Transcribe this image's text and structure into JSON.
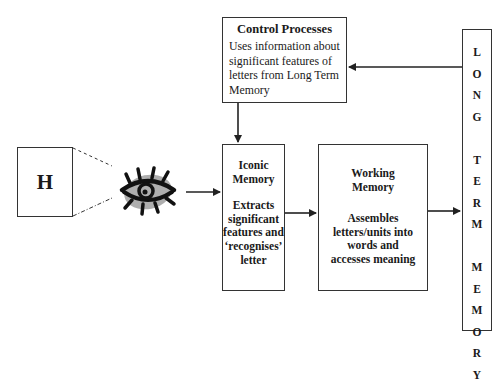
{
  "diagram": {
    "stimulus": {
      "letter": "H"
    },
    "eye": {
      "icon": "eye-icon"
    },
    "control_processes": {
      "title": "Control Processes",
      "lines": [
        "Uses information about",
        "significant features of",
        "letters from Long Term",
        "Memory"
      ]
    },
    "iconic_memory": {
      "title_lines": [
        "Iconic",
        "Memory"
      ],
      "body_lines": [
        "Extracts",
        "significant",
        "features and",
        "‘recognises’",
        "letter"
      ]
    },
    "working_memory": {
      "title_lines": [
        "Working",
        "Memory"
      ],
      "body_lines": [
        "Assembles",
        "letters/units into",
        "words and",
        "accesses meaning"
      ]
    },
    "long_term_memory": {
      "words": [
        "LONG",
        "TERM",
        "MEMORY"
      ],
      "letters": [
        "L",
        "O",
        "N",
        "G",
        "",
        "T",
        "E",
        "R",
        "M",
        "",
        "M",
        "E",
        "M",
        "O",
        "R",
        "Y"
      ]
    },
    "arrows": [
      {
        "from": "long_term_memory",
        "to": "control_processes"
      },
      {
        "from": "control_processes",
        "to": "iconic_memory"
      },
      {
        "from": "eye",
        "to": "iconic_memory"
      },
      {
        "from": "iconic_memory",
        "to": "working_memory"
      },
      {
        "from": "working_memory",
        "to": "long_term_memory"
      }
    ],
    "colors": {
      "line": "#222222",
      "eye_shadow": "#9a9a9a",
      "background": "#ffffff"
    }
  }
}
